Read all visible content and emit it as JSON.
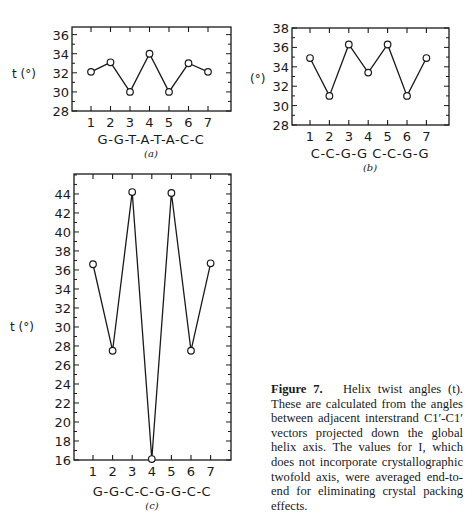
{
  "chart_data": [
    {
      "panel": "(a)",
      "type": "line",
      "x": [
        1,
        2,
        3,
        4,
        5,
        6,
        7
      ],
      "values": [
        32.1,
        33.1,
        30.0,
        34.0,
        30.0,
        33.0,
        32.1
      ],
      "xlabel": "G-G-T-A-T-A-C-C",
      "ylabel": "t (°)",
      "ylim": [
        28,
        36.8
      ],
      "yticks": [
        28,
        30,
        32,
        34,
        36
      ],
      "xticks": [
        1,
        2,
        3,
        4,
        5,
        6,
        7
      ],
      "markers": "open-circle",
      "grid": false
    },
    {
      "panel": "(b)",
      "type": "line",
      "x": [
        1,
        2,
        3,
        4,
        5,
        6,
        7
      ],
      "values": [
        34.9,
        31.0,
        36.3,
        33.4,
        36.3,
        31.0,
        34.9
      ],
      "xlabel": "C-C-G-G  C-C-G-G",
      "ylabel": "(°)",
      "ylim": [
        28,
        38
      ],
      "yticks": [
        28,
        30,
        32,
        34,
        36,
        38
      ],
      "xticks": [
        1,
        2,
        3,
        4,
        5,
        6,
        7
      ],
      "markers": "open-circle",
      "grid": false
    },
    {
      "panel": "(c)",
      "type": "line",
      "x": [
        1,
        2,
        3,
        4,
        5,
        6,
        7
      ],
      "values": [
        36.6,
        27.5,
        44.2,
        16.1,
        44.1,
        27.5,
        36.7
      ],
      "xlabel": "G-G-C-C-G-G-C-C",
      "ylabel": "t (°)",
      "ylim": [
        16,
        46.1
      ],
      "yticks": [
        16,
        18,
        20,
        22,
        24,
        26,
        28,
        30,
        32,
        34,
        36,
        38,
        40,
        42,
        44
      ],
      "xticks": [
        1,
        2,
        3,
        4,
        5,
        6,
        7
      ],
      "markers": "open-circle",
      "grid": false
    }
  ],
  "caption": {
    "label": "Figure 7.",
    "text": "Helix twist angles (t). These are calculated from the angles between adjacent interstrand C1′-C1′ vectors projected down the global helix axis. The values for I, which does not incorporate crystallographic twofold axis, were averaged end-to-end for eliminating crystal packing effects."
  },
  "layout": {
    "panels": [
      {
        "left": 72,
        "right": 231,
        "top": 27,
        "bottom": 111,
        "ymin": 28,
        "ymax": 36.8,
        "x1": 91,
        "xstep": 19.5,
        "ylabel_x": 12,
        "ylabel_y": 78,
        "seq_x": 151,
        "seq_y": 144,
        "panel_y": 157
      },
      {
        "left": 292,
        "right": 449,
        "top": 28,
        "bottom": 125,
        "ymin": 28,
        "ymax": 38,
        "x1": 310,
        "xstep": 19.4,
        "ylabel_x": 250,
        "ylabel_y": 83,
        "seq_x": 370,
        "seq_y": 158,
        "panel_y": 171
      },
      {
        "left": 74,
        "right": 231,
        "top": 174,
        "bottom": 460,
        "ymin": 16,
        "ymax": 46.1,
        "x1": 93,
        "xstep": 19.6,
        "ylabel_x": 10,
        "ylabel_y": 331,
        "seq_x": 152,
        "seq_y": 496,
        "panel_y": 509
      }
    ],
    "ink": "#1a1a1a"
  }
}
